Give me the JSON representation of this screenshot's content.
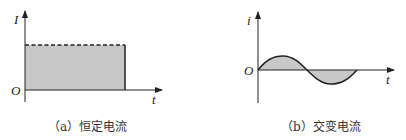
{
  "figure_a": {
    "y_label": "I",
    "origin_label": "O",
    "x_label": "t",
    "caption": "（a）恒定电流",
    "fill_color": "#c8c8c8"
  },
  "figure_b": {
    "y_label": "i",
    "origin_label": "O",
    "x_label": "t",
    "caption": "（b）交变电流",
    "fill_color": "#c8c8c8"
  }
}
